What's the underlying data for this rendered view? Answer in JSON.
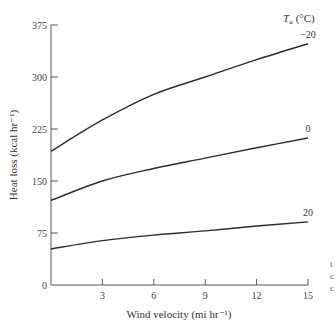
{
  "chart_data": {
    "type": "line",
    "title": "",
    "xlabel": "Wind velocity (mi hr⁻¹)",
    "ylabel": "Heat loss (kcal hr⁻¹)",
    "xlim": [
      0,
      15
    ],
    "ylim": [
      0,
      375
    ],
    "x_ticks": [
      3,
      6,
      9,
      12,
      15
    ],
    "y_ticks": [
      0,
      75,
      150,
      225,
      300,
      375
    ],
    "grid": false,
    "legend_title": "Tₐ (°C)",
    "legend_position": "inline at right end of each curve",
    "x": [
      0,
      3,
      6,
      9,
      12,
      15
    ],
    "series": [
      {
        "name": "-20",
        "label": "−20",
        "values": [
          193,
          238,
          275,
          300,
          325,
          348
        ]
      },
      {
        "name": "0",
        "label": "0",
        "values": [
          122,
          150,
          168,
          183,
          198,
          212
        ]
      },
      {
        "name": "20",
        "label": "20",
        "values": [
          52,
          64,
          72,
          78,
          85,
          91
        ]
      }
    ]
  },
  "labels": {
    "legend_title_main": "T",
    "legend_title_sub": "a",
    "legend_title_unit": "(°C)",
    "x_title": "Wind velocity (mi hr⁻¹)",
    "y_title": "Heat loss (kcal hr⁻¹)"
  },
  "colors": {
    "line": "#2b2b2b",
    "axis": "#555555",
    "text": "#444444"
  }
}
